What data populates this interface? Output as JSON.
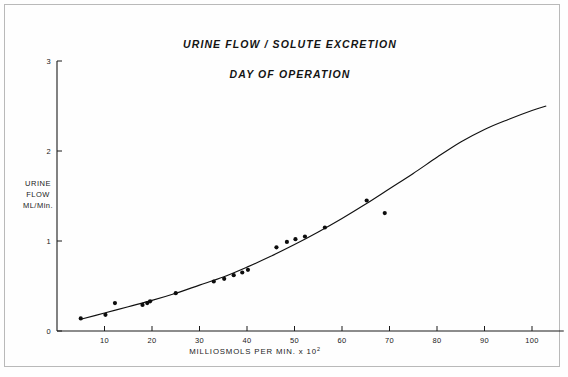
{
  "chart_data": {
    "type": "scatter",
    "title": "URINE FLOW / SOLUTE EXCRETION",
    "subtitle": "DAY OF OPERATION",
    "xlabel": "MILLIOSMOLS PER MIN. x 10",
    "xlabel_superscript": "2",
    "ylabel_lines": [
      "URINE",
      "FLOW",
      "ML/Min."
    ],
    "ylabel": "URINE FLOW ML/Min.",
    "xlim": [
      0,
      105
    ],
    "ylim": [
      0,
      3
    ],
    "xticks": [
      10,
      20,
      30,
      40,
      50,
      60,
      70,
      80,
      90,
      100
    ],
    "xtick_labels": [
      "10",
      "20",
      "30",
      "40",
      "50",
      "60",
      "70",
      "80",
      "90",
      "100"
    ],
    "yticks": [
      0,
      1,
      2,
      3
    ],
    "ytick_labels": [
      "0",
      "1",
      "2",
      "3"
    ],
    "grid": false,
    "legend": "none",
    "series": [
      {
        "name": "observations",
        "marker": "filled-circle",
        "color": "#0d0d0d",
        "points": [
          [
            5.0,
            0.14
          ],
          [
            10.2,
            0.18
          ],
          [
            12.2,
            0.31
          ],
          [
            18.0,
            0.29
          ],
          [
            19.0,
            0.31
          ],
          [
            19.6,
            0.33
          ],
          [
            25.0,
            0.42
          ],
          [
            33.0,
            0.55
          ],
          [
            35.2,
            0.58
          ],
          [
            37.2,
            0.62
          ],
          [
            39.0,
            0.65
          ],
          [
            40.2,
            0.68
          ],
          [
            46.2,
            0.93
          ],
          [
            48.4,
            0.99
          ],
          [
            50.2,
            1.02
          ],
          [
            52.2,
            1.05
          ],
          [
            56.4,
            1.15
          ],
          [
            65.2,
            1.45
          ],
          [
            69.0,
            1.31
          ]
        ]
      },
      {
        "name": "fitted-curve",
        "marker": "none",
        "color": "#111111",
        "points": [
          [
            5.0,
            0.13
          ],
          [
            10.0,
            0.2
          ],
          [
            15.0,
            0.27
          ],
          [
            20.0,
            0.34
          ],
          [
            25.0,
            0.42
          ],
          [
            30.0,
            0.51
          ],
          [
            35.0,
            0.6
          ],
          [
            40.0,
            0.71
          ],
          [
            45.0,
            0.83
          ],
          [
            50.0,
            0.96
          ],
          [
            55.0,
            1.1
          ],
          [
            60.0,
            1.25
          ],
          [
            65.0,
            1.41
          ],
          [
            70.0,
            1.58
          ],
          [
            75.0,
            1.75
          ],
          [
            80.0,
            1.93
          ],
          [
            85.0,
            2.1
          ],
          [
            90.0,
            2.24
          ],
          [
            95.0,
            2.35
          ],
          [
            100.0,
            2.45
          ],
          [
            103.0,
            2.5
          ]
        ]
      }
    ]
  }
}
